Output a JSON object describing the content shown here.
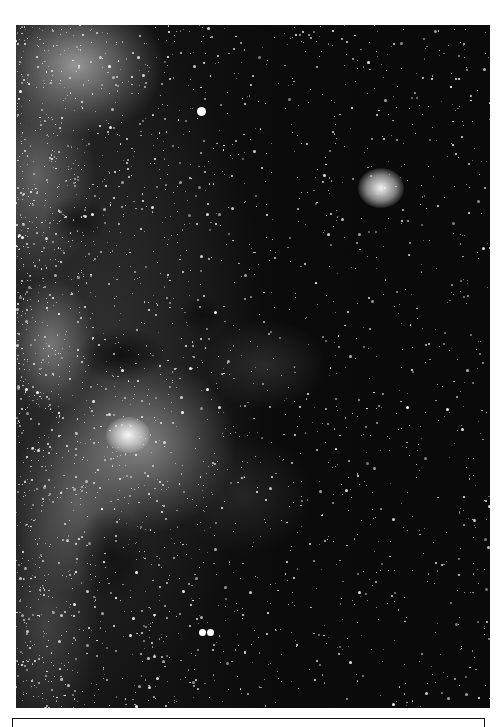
{
  "image": {
    "subject": "Milky Way star field",
    "tone": "black-and-white photograph",
    "colors": {
      "sky": "#0a0a0a",
      "stars": "#ffffff",
      "milky_way_glow": "#bebebe",
      "page": "#ffffff",
      "frame_line": "#111111"
    },
    "features": [
      {
        "name": "open-star-cluster",
        "x": 365,
        "y": 163
      },
      {
        "name": "bright-star",
        "x": 204,
        "y": 114
      },
      {
        "name": "nebula-with-cluster",
        "x": 125,
        "y": 410
      },
      {
        "name": "double-star",
        "x": 205,
        "y": 633
      },
      {
        "name": "milky-way-band",
        "side": "left"
      }
    ]
  },
  "caption_box": {
    "text": ""
  }
}
